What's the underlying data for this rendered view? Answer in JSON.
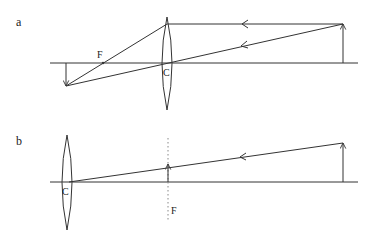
{
  "diagram": {
    "type": "thin-lens ray diagram",
    "panels": [
      {
        "label": "a",
        "focal_label": "F",
        "center_label": "C",
        "description": "Object beyond focal point on right; real inverted image formed on left"
      },
      {
        "label": "b",
        "focal_label": "F",
        "center_label": "C",
        "description": "Distant object; image formed at focal plane (dotted line)"
      }
    ],
    "colors": {
      "line": "#333333",
      "dotted": "#888888"
    }
  }
}
